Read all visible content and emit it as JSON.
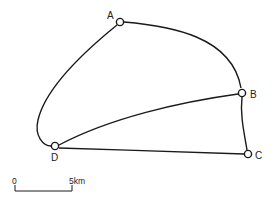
{
  "diagram": {
    "type": "network-map",
    "nodes": [
      {
        "id": "A",
        "label": "A",
        "x": 120,
        "y": 22
      },
      {
        "id": "B",
        "label": "B",
        "x": 242,
        "y": 93
      },
      {
        "id": "C",
        "label": "C",
        "x": 248,
        "y": 154
      },
      {
        "id": "D",
        "label": "D",
        "x": 55,
        "y": 146
      }
    ],
    "edges": [
      {
        "from": "A",
        "to": "B",
        "curved": true
      },
      {
        "from": "A",
        "to": "D",
        "curved": true
      },
      {
        "from": "B",
        "to": "C",
        "curved": false
      },
      {
        "from": "B",
        "to": "D",
        "curved": false
      },
      {
        "from": "D",
        "to": "C",
        "curved": false
      }
    ],
    "scale": {
      "start_label": "0",
      "end_label": "5km"
    },
    "line_color": "#1a1a1a"
  }
}
